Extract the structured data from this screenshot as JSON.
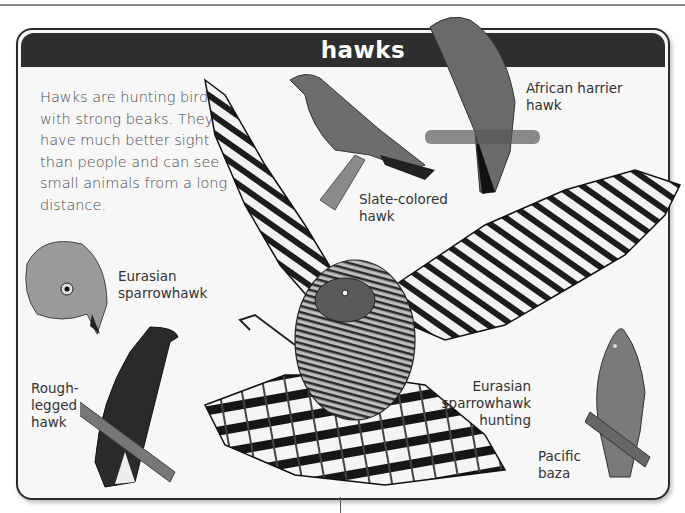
{
  "page": {
    "title": "hawks",
    "intro_text": "Hawks are hunting birds with strong beaks. They have much better sight than people and can see small animals from a long distance.",
    "colors": {
      "header_bar": "#2e2e2e",
      "header_text": "#ffffff",
      "panel_background": "#f7f7f7",
      "frame_border": "#2a2a2a",
      "body_text": "#4a4a4a"
    }
  },
  "illustrations": [
    {
      "id": "african-harrier-hawk",
      "label": "African harrier\nhawk"
    },
    {
      "id": "slate-colored-hawk",
      "label": "Slate-colored\nhawk"
    },
    {
      "id": "eurasian-sparrowhawk",
      "label": "Eurasian\nsparrowhawk"
    },
    {
      "id": "rough-legged-hawk",
      "label": "Rough-\nlegged\nhawk"
    },
    {
      "id": "eurasian-sparrowhawk-hunting",
      "label": "Eurasian\nsparrowhawk\nhunting"
    },
    {
      "id": "pacific-baza",
      "label": "Pacific\nbaza"
    }
  ]
}
